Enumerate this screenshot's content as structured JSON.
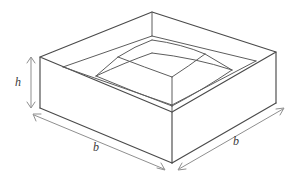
{
  "figure": {
    "stroke_color": "#4a4a4a",
    "inner_stroke_color": "#5d5d5d",
    "dimension_color": "#8f8f8f",
    "label_color": "#3a3a3a",
    "background_color": "#ffffff"
  },
  "labels": {
    "height": "h",
    "base_left": "b",
    "base_right": "b"
  },
  "dimensions": {
    "height_arrow": "double-headed-vertical-arrow",
    "base_left_arrow": "double-headed-arrow",
    "base_right_arrow": "double-headed-arrow"
  },
  "geometry": {
    "outer_top": {
      "back": [
        152,
        12
      ],
      "left": [
        40,
        57
      ],
      "front": [
        172,
        112
      ],
      "right": [
        276,
        52
      ]
    },
    "outer_bottom": {
      "left": [
        40,
        108
      ],
      "front": [
        172,
        163
      ],
      "right": [
        276,
        103
      ]
    },
    "inner_top": {
      "back": [
        152,
        36
      ],
      "left": [
        63,
        67
      ],
      "front": [
        172,
        105
      ],
      "right": [
        256,
        61
      ]
    },
    "mound_base": {
      "back": [
        152,
        53
      ],
      "left": [
        96,
        76
      ],
      "front": [
        172,
        106
      ],
      "right": [
        232,
        70
      ]
    },
    "mound_top": {
      "back": [
        152,
        40
      ],
      "left": [
        118,
        57
      ],
      "front": [
        172,
        77
      ],
      "right": [
        205,
        54
      ]
    }
  }
}
